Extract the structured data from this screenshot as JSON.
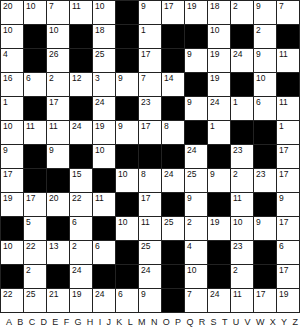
{
  "puzzle": {
    "type": "codeword",
    "rows": 13,
    "cols": 13,
    "grid": [
      [
        20,
        10,
        7,
        11,
        10,
        null,
        9,
        17,
        19,
        18,
        2,
        9,
        7
      ],
      [
        10,
        null,
        10,
        null,
        18,
        null,
        1,
        null,
        null,
        10,
        null,
        2,
        null
      ],
      [
        4,
        null,
        26,
        null,
        25,
        null,
        17,
        null,
        9,
        19,
        24,
        9,
        11
      ],
      [
        16,
        6,
        2,
        12,
        3,
        9,
        7,
        14,
        null,
        19,
        null,
        10,
        null
      ],
      [
        1,
        null,
        17,
        null,
        24,
        null,
        23,
        null,
        9,
        24,
        1,
        6,
        11
      ],
      [
        10,
        11,
        11,
        24,
        19,
        9,
        17,
        8,
        null,
        1,
        null,
        null,
        1
      ],
      [
        9,
        null,
        9,
        null,
        10,
        null,
        null,
        null,
        24,
        null,
        23,
        null,
        17
      ],
      [
        17,
        null,
        null,
        15,
        null,
        10,
        8,
        24,
        25,
        9,
        2,
        23,
        17
      ],
      [
        19,
        17,
        20,
        22,
        11,
        null,
        17,
        null,
        9,
        null,
        11,
        null,
        9
      ],
      [
        null,
        5,
        null,
        6,
        null,
        10,
        11,
        25,
        2,
        19,
        10,
        9,
        17
      ],
      [
        10,
        22,
        13,
        2,
        6,
        null,
        25,
        null,
        4,
        null,
        23,
        null,
        6
      ],
      [
        null,
        2,
        null,
        24,
        null,
        null,
        24,
        null,
        10,
        null,
        2,
        null,
        17
      ],
      [
        22,
        25,
        21,
        19,
        24,
        6,
        9,
        null,
        7,
        24,
        11,
        17,
        19
      ]
    ]
  },
  "alphabet": [
    "A",
    "B",
    "C",
    "D",
    "E",
    "F",
    "G",
    "H",
    "I",
    "J",
    "K",
    "L",
    "M",
    "N",
    "O",
    "P",
    "Q",
    "R",
    "S",
    "T",
    "U",
    "V",
    "W",
    "X",
    "Y",
    "Z"
  ]
}
